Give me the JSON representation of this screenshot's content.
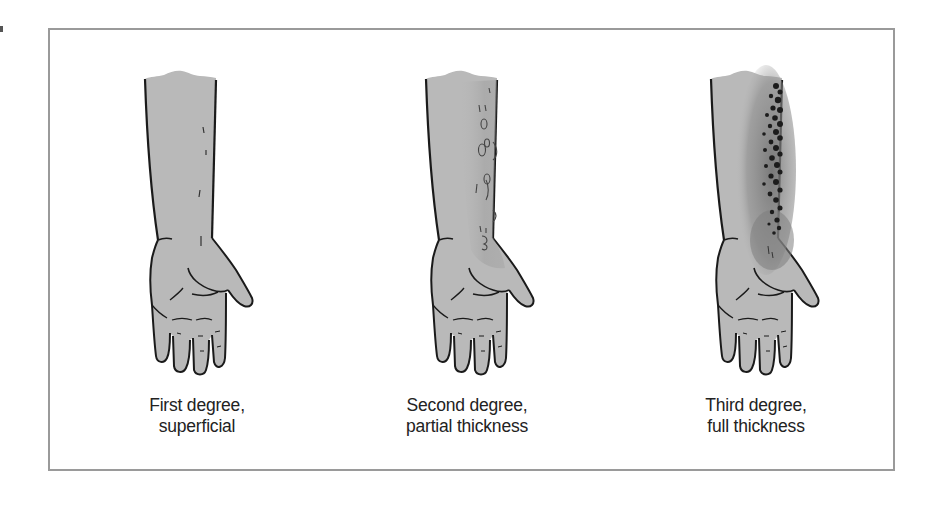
{
  "figure": {
    "type": "burn-depth-illustration",
    "panels": [
      {
        "id": "first",
        "caption_line1": "First degree,",
        "caption_line2": "superficial",
        "offset_x": 0,
        "skin_color": "#b9b9b9",
        "burn_intensity": "none"
      },
      {
        "id": "second",
        "caption_line1": "Second degree,",
        "caption_line2": "partial thickness",
        "offset_x": 281,
        "skin_color": "#b4b4b4",
        "burn_intensity": "blisters"
      },
      {
        "id": "third",
        "caption_line1": "Third degree,",
        "caption_line2": "full thickness",
        "offset_x": 566,
        "skin_color": "#b4b4b4",
        "burn_intensity": "charred"
      }
    ],
    "colors": {
      "frame_border": "#9a9a9a",
      "outline": "#1a1a1a",
      "skin": "#b9b9b9",
      "burn_shadow": "#7a7a7a",
      "char": "#1c1c1c",
      "caption_text": "#222222"
    }
  }
}
